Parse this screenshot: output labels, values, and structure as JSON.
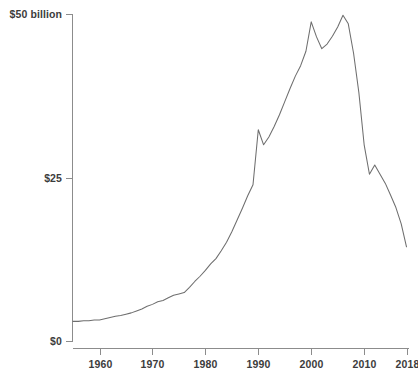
{
  "chart_data": {
    "type": "line",
    "title": "",
    "subtitle": "",
    "xlabel": "",
    "ylabel": "",
    "xlim": [
      1955,
      2018
    ],
    "ylim": [
      0,
      50
    ],
    "grid": false,
    "legend": "none",
    "units": "billions of dollars",
    "y_ticks": [
      {
        "value": 0,
        "label": "$0"
      },
      {
        "value": 25,
        "label": "$25"
      },
      {
        "value": 50,
        "label": "$50 billion"
      }
    ],
    "x_ticks": [
      {
        "value": 1960,
        "label": "1960"
      },
      {
        "value": 1970,
        "label": "1970"
      },
      {
        "value": 1980,
        "label": "1980"
      },
      {
        "value": 1990,
        "label": "1990"
      },
      {
        "value": 2000,
        "label": "2000"
      },
      {
        "value": 2010,
        "label": "2010"
      },
      {
        "value": 2018,
        "label": "2018"
      }
    ],
    "series": [
      {
        "name": "value",
        "color": "#6e6e6e",
        "x": [
          1955,
          1956,
          1957,
          1958,
          1959,
          1960,
          1961,
          1962,
          1963,
          1964,
          1965,
          1966,
          1967,
          1968,
          1969,
          1970,
          1971,
          1972,
          1973,
          1974,
          1975,
          1976,
          1977,
          1978,
          1979,
          1980,
          1981,
          1982,
          1983,
          1984,
          1985,
          1986,
          1987,
          1988,
          1989,
          1990,
          1991,
          1992,
          1993,
          1994,
          1995,
          1996,
          1997,
          1998,
          1999,
          2000,
          2001,
          2002,
          2003,
          2004,
          2005,
          2006,
          2007,
          2008,
          2009,
          2010,
          2011,
          2012,
          2013,
          2014,
          2015,
          2016,
          2017,
          2018
        ],
        "y": [
          3.0,
          3.0,
          3.1,
          3.1,
          3.2,
          3.2,
          3.4,
          3.6,
          3.8,
          3.9,
          4.1,
          4.3,
          4.6,
          4.9,
          5.3,
          5.6,
          6.0,
          6.2,
          6.6,
          7.0,
          7.2,
          7.4,
          8.2,
          9.1,
          9.9,
          10.8,
          11.8,
          12.6,
          13.8,
          15.1,
          16.7,
          18.5,
          20.3,
          22.2,
          23.9,
          32.3,
          30.0,
          31.2,
          32.8,
          34.6,
          36.6,
          38.6,
          40.5,
          42.1,
          44.3,
          48.8,
          46.5,
          44.7,
          45.4,
          46.6,
          48.0,
          49.8,
          48.5,
          44.0,
          38.0,
          30.0,
          25.5,
          26.9,
          25.5,
          24.1,
          22.3,
          20.4,
          17.9,
          14.4
        ]
      }
    ]
  },
  "axis": {
    "y_axis_name": "y-axis",
    "x_axis_name": "x-axis"
  }
}
